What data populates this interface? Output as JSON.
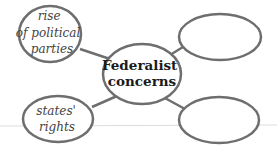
{
  "diagram": {
    "type": "web-organizer",
    "baseline_color": "#dcdcdc",
    "stroke_color": "#6e6e6e",
    "center": {
      "lines": [
        "Federalist",
        "concerns"
      ]
    },
    "nodes": [
      {
        "position": "top-left",
        "lines": [
          "rise",
          "of political",
          "parties"
        ]
      },
      {
        "position": "top-right",
        "lines": []
      },
      {
        "position": "bottom-left",
        "lines": [
          "states'",
          "rights"
        ]
      },
      {
        "position": "bottom-right",
        "lines": []
      }
    ]
  }
}
